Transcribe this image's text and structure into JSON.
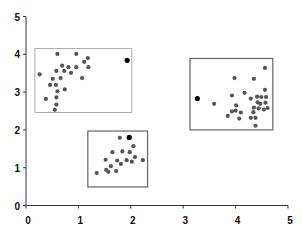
{
  "chart_data": {
    "type": "scatter",
    "title": "",
    "xlabel": "",
    "ylabel": "",
    "xlim": [
      0,
      5
    ],
    "ylim": [
      0,
      5
    ],
    "xticks": [
      0,
      1,
      2,
      3,
      4,
      5
    ],
    "yticks": [
      0,
      1,
      2,
      3,
      4,
      5
    ],
    "grid": false,
    "legend": null,
    "colors": {
      "points": "#555555",
      "outliers": "#000000",
      "box_light": "#999999",
      "box_dark": "#666666",
      "axis": "#333333"
    },
    "clusters": [
      {
        "name": "cluster-1",
        "box": {
          "x0": 0.17,
          "x1": 2.02,
          "y0": 2.46,
          "y1": 4.15,
          "style": "light"
        },
        "points": [
          [
            0.6,
            4.01
          ],
          [
            0.96,
            4.01
          ],
          [
            1.18,
            3.9
          ],
          [
            1.11,
            3.8
          ],
          [
            0.69,
            3.7
          ],
          [
            0.81,
            3.66
          ],
          [
            0.96,
            3.66
          ],
          [
            1.19,
            3.66
          ],
          [
            0.58,
            3.56
          ],
          [
            0.73,
            3.56
          ],
          [
            0.86,
            3.51
          ],
          [
            0.26,
            3.47
          ],
          [
            1.07,
            3.37
          ],
          [
            0.66,
            3.37
          ],
          [
            0.51,
            3.35
          ],
          [
            0.46,
            3.19
          ],
          [
            0.57,
            3.19
          ],
          [
            0.74,
            3.07
          ],
          [
            0.6,
            3.02
          ],
          [
            0.38,
            2.82
          ],
          [
            0.58,
            2.86
          ],
          [
            0.58,
            2.67
          ],
          [
            0.55,
            2.53
          ]
        ],
        "outlier": [
          1.93,
          3.84
        ]
      },
      {
        "name": "cluster-2",
        "box": {
          "x0": 1.18,
          "x1": 2.32,
          "y0": 0.49,
          "y1": 1.97,
          "style": "dark"
        },
        "points": [
          [
            1.79,
            1.79
          ],
          [
            2.05,
            1.57
          ],
          [
            1.65,
            1.41
          ],
          [
            1.84,
            1.43
          ],
          [
            1.98,
            1.41
          ],
          [
            2.08,
            1.28
          ],
          [
            1.52,
            1.21
          ],
          [
            1.74,
            1.19
          ],
          [
            1.92,
            1.2
          ],
          [
            2.02,
            1.16
          ],
          [
            2.23,
            1.2
          ],
          [
            1.81,
            1.1
          ],
          [
            1.62,
            1.04
          ],
          [
            1.53,
            0.94
          ],
          [
            1.57,
            0.89
          ],
          [
            1.72,
            0.91
          ],
          [
            1.35,
            0.86
          ]
        ],
        "outlier": [
          1.97,
          1.8
        ]
      },
      {
        "name": "cluster-3",
        "box": {
          "x0": 3.13,
          "x1": 4.71,
          "y0": 2.0,
          "y1": 3.89,
          "style": "dark"
        },
        "points": [
          [
            4.56,
            3.64
          ],
          [
            3.98,
            3.37
          ],
          [
            4.35,
            3.35
          ],
          [
            4.56,
            3.06
          ],
          [
            4.17,
            2.98
          ],
          [
            3.93,
            2.91
          ],
          [
            4.41,
            2.88
          ],
          [
            4.49,
            2.87
          ],
          [
            4.58,
            2.87
          ],
          [
            4.29,
            2.83
          ],
          [
            3.59,
            2.69
          ],
          [
            4.01,
            2.65
          ],
          [
            4.42,
            2.73
          ],
          [
            4.47,
            2.69
          ],
          [
            4.57,
            2.72
          ],
          [
            4.35,
            2.59
          ],
          [
            4.44,
            2.57
          ],
          [
            4.61,
            2.58
          ],
          [
            4.54,
            2.54
          ],
          [
            3.93,
            2.49
          ],
          [
            4.0,
            2.51
          ],
          [
            4.1,
            2.46
          ],
          [
            4.34,
            2.47
          ],
          [
            3.85,
            2.37
          ],
          [
            4.07,
            2.3
          ],
          [
            4.29,
            2.32
          ],
          [
            4.38,
            2.32
          ],
          [
            4.38,
            2.11
          ]
        ],
        "outlier": [
          3.27,
          2.83
        ]
      }
    ]
  }
}
